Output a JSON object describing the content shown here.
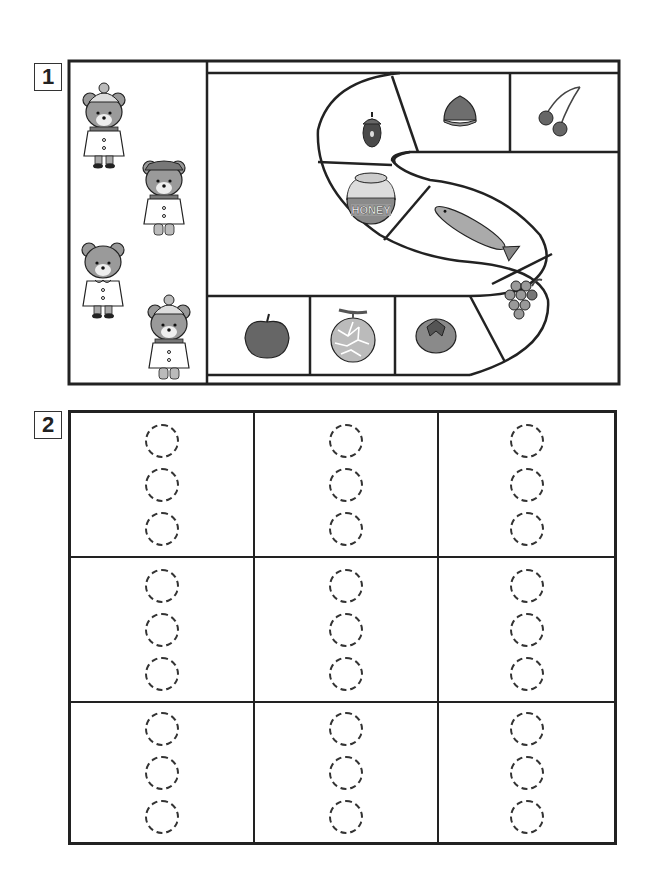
{
  "worksheet": {
    "question1": {
      "number": "1",
      "characters": [
        {
          "name": "bear-with-pompom-hat-and-scarf-boots-shoes",
          "outfit": "pompom hat, scarf, coat, shoes"
        },
        {
          "name": "bear-with-brim-hat-and-scarf-boots",
          "outfit": "brim hat, scarf, coat, boots"
        },
        {
          "name": "bear-with-collar-coat",
          "outfit": "collar coat, shoes"
        },
        {
          "name": "bear-with-pompom-hat-scarf-boots",
          "outfit": "pompom hat, scarf, coat, boots"
        }
      ],
      "path_items": [
        {
          "icon": "acorn-icon",
          "label": "acorn"
        },
        {
          "icon": "chestnut-icon",
          "label": "chestnut"
        },
        {
          "icon": "cherry-icon",
          "label": "cherries"
        },
        {
          "icon": "honey-pot-icon",
          "label": "HONEY"
        },
        {
          "icon": "fish-icon",
          "label": "salmon"
        },
        {
          "icon": "grapes-icon",
          "label": "grapes"
        },
        {
          "icon": "persimmon-icon",
          "label": "persimmon"
        },
        {
          "icon": "melon-icon",
          "label": "melon"
        },
        {
          "icon": "apple-icon",
          "label": "apple"
        }
      ]
    },
    "question2": {
      "number": "2",
      "grid": {
        "rows": 3,
        "cols": 3,
        "circles_per_cell": 3
      }
    }
  },
  "colors": {
    "line": "#222222",
    "fill_gray": "#8a8a8a",
    "fill_light": "#c4c4c4",
    "fill_dark": "#4a4a4a"
  }
}
